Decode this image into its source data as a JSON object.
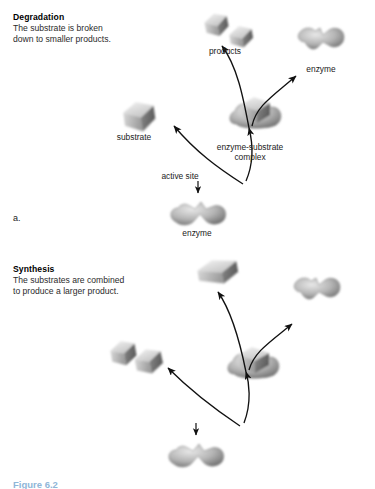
{
  "figure": {
    "caption": "Figure 6.2",
    "panels": [
      {
        "marker": "a.",
        "title": "Degradation",
        "description_lines": [
          "The substrate is broken",
          "down to smaller products."
        ],
        "labels": {
          "products": "products",
          "enzyme_free": "enzyme",
          "substrate": "substrate",
          "complex": "enzyme-substrate",
          "complex_line2": "complex",
          "active_site": "active site",
          "enzyme_bottom": "enzyme"
        }
      },
      {
        "marker": "b.",
        "title": "Synthesis",
        "description_lines": [
          "The substrates are combined",
          "to produce a larger product."
        ],
        "labels": {
          "product": "product",
          "enzyme_free": "enzyme",
          "substrates": "substrates",
          "complex": "enzyme-substrate",
          "complex_line2": "complex",
          "active_site": "active site",
          "enzyme_bottom": "enzyme"
        }
      }
    ]
  },
  "colors": {
    "enzyme_light": "#cfcfcf",
    "enzyme_mid": "#9a9a9a",
    "enzyme_dark": "#5e5e5e",
    "cube_light": "#e2e2e2",
    "cube_mid": "#a8a8a8",
    "cube_dark": "#6b6b6b",
    "arrow": "#111111",
    "text": "#222222",
    "caption": "#8fb6d8"
  }
}
